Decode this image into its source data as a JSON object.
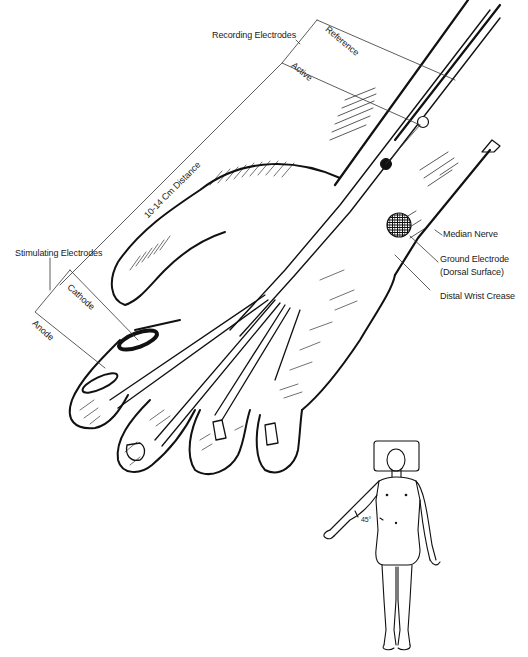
{
  "figure": {
    "labels": {
      "recording_electrodes": "Recording Electrodes",
      "reference": "Reference",
      "active": "Active",
      "distance": "10-14 Cm Distance",
      "stimulating_electrodes": "Stimulating Electrodes",
      "cathode": "Cathode",
      "anode": "Anode",
      "median_nerve": "Median Nerve",
      "ground_electrode_line1": "Ground Electrode",
      "ground_electrode_line2": "(Dorsal Surface)",
      "distal_wrist_crease": "Distal Wrist Crease",
      "arm_angle": "45°"
    },
    "elements": {
      "reference_electrode": "open circle on forearm",
      "active_electrode": "filled circle on forearm",
      "ground_electrode": "cross-hatched circle on dorsal wrist",
      "ring_cathode": "dark ring on index finger, proximal",
      "ring_anode": "ring on index finger, distal",
      "patient_figure": "supine body on pillow with right arm abducted 45°"
    }
  }
}
